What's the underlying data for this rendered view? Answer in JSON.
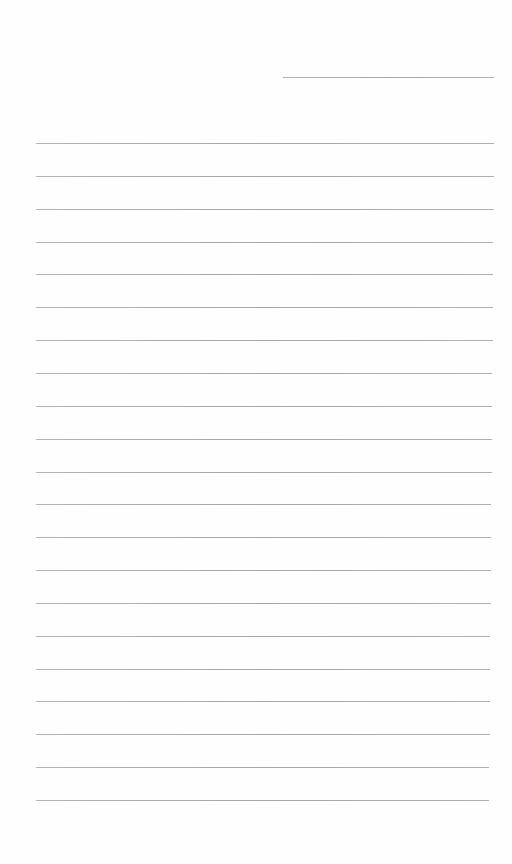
{
  "page": {
    "type": "lined-paper",
    "background_color": "#fefefe",
    "line_color": "#aaaaaa",
    "header_line": {
      "x": 283,
      "y": 77,
      "width": 211
    },
    "ruled_lines": {
      "count": 21,
      "first_y": 143,
      "spacing": 32.85,
      "left": 36,
      "right_start": 494,
      "right_end": 489
    }
  }
}
